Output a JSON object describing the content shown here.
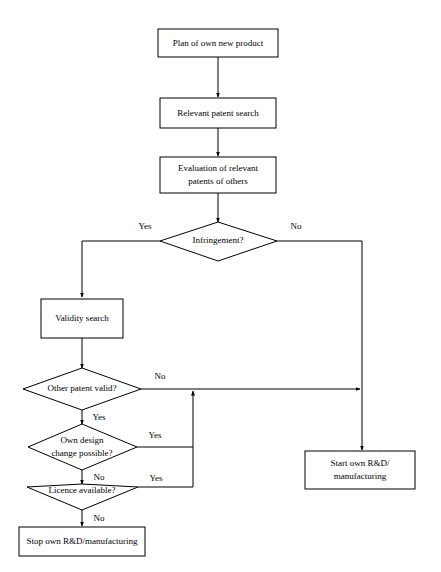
{
  "diagram": {
    "type": "flowchart",
    "background_color": "#ffffff",
    "line_color": "#000000",
    "text_color": "#000000",
    "nodes": [
      {
        "id": "plan",
        "shape": "process",
        "label": "Plan of own new product",
        "lines": [
          "Plan of own new product"
        ]
      },
      {
        "id": "search",
        "shape": "process",
        "label": "Relevant patent search",
        "lines": [
          "Relevant patent search"
        ]
      },
      {
        "id": "evaluation",
        "shape": "process",
        "label": "Evaluation of relevant patents of others",
        "lines": [
          "Evaluation of relevant",
          "patents of others"
        ]
      },
      {
        "id": "infringe",
        "shape": "decision",
        "label": "Infringement?",
        "lines": [
          "Infringement?"
        ]
      },
      {
        "id": "validity",
        "shape": "process",
        "label": "Validity search",
        "lines": [
          "Validity search"
        ]
      },
      {
        "id": "othervalid",
        "shape": "decision",
        "label": "Other patent valid?",
        "lines": [
          "Other patent valid?"
        ]
      },
      {
        "id": "designchange",
        "shape": "decision",
        "label": "Own design change possible?",
        "lines": [
          "Own design",
          "change possible?"
        ]
      },
      {
        "id": "licence",
        "shape": "decision",
        "label": "Licence available?",
        "lines": [
          "Licence available?"
        ]
      },
      {
        "id": "stop",
        "shape": "process",
        "label": "Stop own R&D/manufacturing",
        "lines": [
          "Stop own R&D/manufacturing"
        ]
      },
      {
        "id": "start",
        "shape": "process",
        "label": "Start own R&D/manufacturing",
        "lines": [
          "Start own R&D/",
          "manufacturing"
        ]
      }
    ],
    "edges": [
      {
        "from": "plan",
        "to": "search",
        "label": ""
      },
      {
        "from": "search",
        "to": "evaluation",
        "label": ""
      },
      {
        "from": "evaluation",
        "to": "infringe",
        "label": ""
      },
      {
        "from": "infringe",
        "to": "validity",
        "label": "Yes"
      },
      {
        "from": "infringe",
        "to": "start",
        "label": "No"
      },
      {
        "from": "validity",
        "to": "othervalid",
        "label": ""
      },
      {
        "from": "othervalid",
        "to": "start",
        "label": "No"
      },
      {
        "from": "othervalid",
        "to": "designchange",
        "label": "Yes"
      },
      {
        "from": "designchange",
        "to": "start",
        "label": "Yes"
      },
      {
        "from": "designchange",
        "to": "licence",
        "label": "No"
      },
      {
        "from": "licence",
        "to": "start",
        "label": "Yes"
      },
      {
        "from": "licence",
        "to": "stop",
        "label": "No"
      }
    ],
    "edge_labels": {
      "infringe_yes": "Yes",
      "infringe_no": "No",
      "othervalid_no": "No",
      "othervalid_yes": "Yes",
      "designchange_yes": "Yes",
      "designchange_no": "No",
      "licence_yes": "Yes",
      "licence_no": "No"
    }
  }
}
